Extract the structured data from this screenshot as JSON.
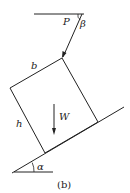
{
  "diagram": {
    "labels": {
      "force": "P",
      "force_angle": "β",
      "width": "b",
      "height": "h",
      "weight": "W",
      "incline_angle": "α"
    },
    "caption": "(b)",
    "colors": {
      "line": "#222222",
      "background": "#ffffff"
    }
  }
}
